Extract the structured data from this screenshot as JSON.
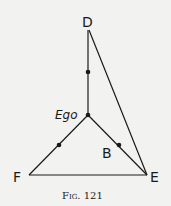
{
  "figure": {
    "caption": "Fig. 121",
    "labels": {
      "D": "D",
      "ego": "Ego",
      "B": "B",
      "F": "F",
      "E": "E"
    },
    "points": {
      "D": [
        88,
        30
      ],
      "mid_D_ego": [
        88,
        72
      ],
      "ego": [
        88,
        115
      ],
      "mid_ego_F": [
        59,
        145
      ],
      "B": [
        119,
        145
      ],
      "F": [
        29,
        175
      ],
      "E": [
        147,
        175
      ]
    },
    "edges": [
      [
        "D",
        "ego"
      ],
      [
        "ego",
        "F"
      ],
      [
        "ego",
        "E"
      ],
      [
        "F",
        "E"
      ],
      [
        "D",
        "E"
      ]
    ],
    "colors": {
      "ink": "#1a1a1a",
      "paper": "#f2f2f0"
    }
  }
}
